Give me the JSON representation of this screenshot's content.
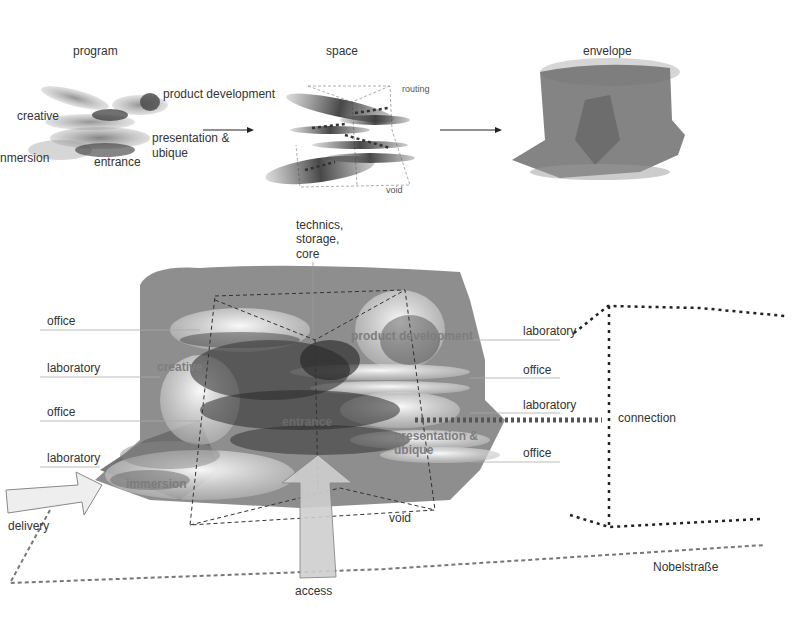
{
  "top_row": {
    "program": {
      "title": "program",
      "labels": {
        "product_development": "product development",
        "creative": "creative",
        "presentation_line1": "presentation &",
        "presentation_line2": "ubique",
        "immersion": "nmersion",
        "entrance": "entrance"
      }
    },
    "space": {
      "title": "space",
      "labels": {
        "routing": "routing",
        "void": "void"
      }
    },
    "envelope": {
      "title": "envelope"
    }
  },
  "main": {
    "core_label": [
      "technics,",
      "storage,",
      "core"
    ],
    "left_labels": [
      "office",
      "laboratory",
      "office",
      "laboratory"
    ],
    "right_labels": [
      "laboratory",
      "office",
      "laboratory",
      "office"
    ],
    "inner_labels": {
      "product_development": "product development",
      "creative": "creative",
      "entrance": "entrance",
      "presentation_line1": "presentation &",
      "presentation_line2": "ubique",
      "immersion": "immersion"
    },
    "void": "void",
    "connection": "connection",
    "delivery": "delivery",
    "access": "access",
    "street": "Nobelstraße"
  },
  "colors": {
    "envelope_fill": "#6e6e6e",
    "label_text": "#333333",
    "inner_label": "#7d7d7d",
    "dotted_line": "#222222"
  }
}
